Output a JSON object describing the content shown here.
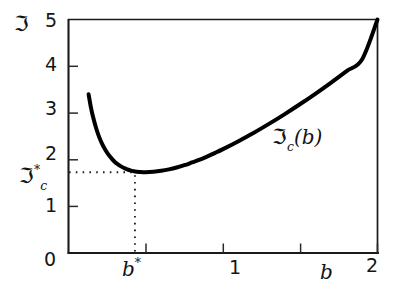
{
  "chart_data": {
    "type": "line",
    "title": "",
    "xlabel": "b",
    "ylabel": "ℑ",
    "xlim": [
      0,
      2
    ],
    "ylim": [
      0,
      5
    ],
    "grid": false,
    "legend_position": "inline-annotation",
    "x_ticks": [
      {
        "value": 0,
        "label": "0"
      },
      {
        "value": 0.5,
        "label": ""
      },
      {
        "value": 1,
        "label": "1"
      },
      {
        "value": 1.5,
        "label": ""
      },
      {
        "value": 2,
        "label": "2"
      }
    ],
    "y_ticks": [
      {
        "value": 0,
        "label": "0"
      },
      {
        "value": 1,
        "label": "1"
      },
      {
        "value": 2,
        "label": "2"
      },
      {
        "value": 3,
        "label": "3"
      },
      {
        "value": 4,
        "label": "4"
      },
      {
        "value": 5,
        "label": "5"
      }
    ],
    "series": [
      {
        "name": "ℑ_c(b)",
        "annotation": "ℑc(b)",
        "x": [
          0.13,
          0.145,
          0.16,
          0.18,
          0.2,
          0.22,
          0.24,
          0.26,
          0.28,
          0.3,
          0.32,
          0.34,
          0.36,
          0.38,
          0.4,
          0.43,
          0.46,
          0.5,
          0.55,
          0.6,
          0.65,
          0.7,
          0.75,
          0.8,
          0.85,
          0.9,
          0.95,
          1.0,
          1.1,
          1.2,
          1.3,
          1.4,
          1.5,
          1.6,
          1.7,
          1.8,
          1.9,
          2.0
        ],
        "y": [
          3.4,
          3.12,
          2.9,
          2.66,
          2.47,
          2.32,
          2.2,
          2.1,
          2.02,
          1.95,
          1.9,
          1.855,
          1.82,
          1.79,
          1.77,
          1.745,
          1.735,
          1.73,
          1.74,
          1.76,
          1.79,
          1.83,
          1.88,
          1.94,
          2.0,
          2.07,
          2.145,
          2.225,
          2.395,
          2.575,
          2.77,
          2.975,
          3.19,
          3.415,
          3.65,
          3.895,
          4.145,
          5.0
        ]
      }
    ],
    "annotations": [
      {
        "name": "critical-point-marker",
        "x": 0.43,
        "y": 1.73,
        "style": "dotted-guides"
      }
    ]
  },
  "axes": {
    "y_symbol": "ℑ",
    "y_critical": {
      "base": "ℑ",
      "superscript": "*",
      "subscript": "c"
    },
    "x_name": "b",
    "x_critical": {
      "base": "b",
      "superscript": "*"
    }
  },
  "ticks": {
    "y": {
      "t5": "5",
      "t4": "4",
      "t3": "3",
      "t2": "2",
      "t1": "1",
      "t0": "0"
    },
    "x": {
      "t1": "1",
      "t2": "2"
    }
  },
  "curve_label": {
    "base": "ℑ",
    "subscript": "c",
    "argument": "(b)"
  },
  "colors": {
    "curve": "#000000",
    "axis": "#1a1a1a",
    "guide": "#202020",
    "background": "#ffffff"
  }
}
